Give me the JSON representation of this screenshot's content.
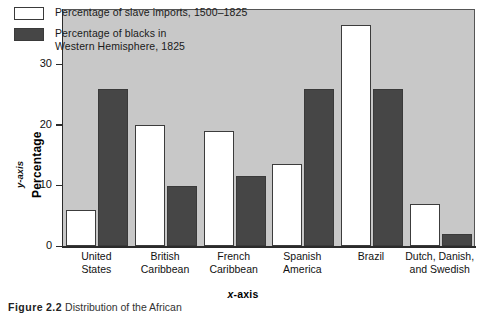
{
  "chart_data": {
    "type": "bar",
    "title": "",
    "xlabel": "x-axis",
    "ylabel": "Percentage",
    "ylabel_secondary": "y-axis",
    "categories": [
      "United\nStates",
      "British\nCaribbean",
      "French\nCaribbean",
      "Spanish\nAmerica",
      "Brazil",
      "Dutch, Danish,\nand Swedish"
    ],
    "series": [
      {
        "name": "Percentage of slave imports, 1500–1825",
        "color": "#ffffff",
        "values": [
          6,
          20,
          19,
          13.5,
          36.5,
          7
        ]
      },
      {
        "name": "Percentage of blacks in\nWestern Hemisphere, 1825",
        "color": "#464646",
        "values": [
          26,
          10,
          11.5,
          26,
          26,
          2
        ]
      }
    ],
    "ylim": [
      0,
      39
    ],
    "yticks": [
      0,
      10,
      20,
      30
    ],
    "ytick_labels": [
      "0",
      "10",
      "20",
      "30"
    ],
    "grid": false,
    "legend_position": "top-left",
    "plot_background": "#c8c8c8"
  },
  "legend": {
    "items": [
      {
        "label": "Percentage of slave imports, 1500–1825",
        "swatch": "light"
      },
      {
        "label": "Percentage of blacks in\nWestern Hemisphere, 1825",
        "swatch": "dark"
      }
    ]
  },
  "axes": {
    "x_title_prefix": "x",
    "x_title_suffix": "-axis",
    "y_title_prefix": "y",
    "y_title_suffix": "-axis",
    "y_main_label": "Percentage"
  },
  "caption": {
    "label": "Figure",
    "number": "2.2",
    "text": "Distribution of the African"
  }
}
